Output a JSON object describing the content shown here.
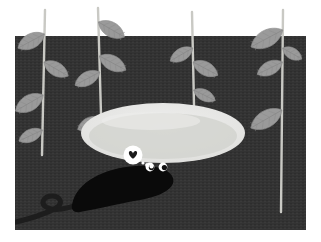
{
  "scene": {
    "title": "Slug dreaming of love beside a puddle",
    "width": 321,
    "height": 242,
    "caption": ""
  },
  "palette": {
    "page_background": "#ffffff",
    "sky_background": "#ffffff",
    "soil_dark": "#333333",
    "soil_texture": "#3b3b3b",
    "soil_shadow": "#262626",
    "puddle_rim": "#e8e8e6",
    "puddle_fill": "#d2d3cf",
    "puddle_highlight": "#ececeb",
    "leaf_fill": "#9a9a9a",
    "leaf_vein": "#8a8a8a",
    "leaf_fill_light": "#a8a8a8",
    "stem_color": "#c9c9c4",
    "slug_body": "#0a0a0a",
    "eye_white": "#ffffff",
    "eye_pupil": "#111111",
    "bubble_white": "#ffffff",
    "heart_color": "#1a1a1a",
    "tail_dark": "#1d1d1d"
  },
  "ground": {
    "label": "dark soil background",
    "x": 15,
    "y": 36,
    "width": 291,
    "height": 194
  },
  "puddle": {
    "label": "puddle",
    "cx": 163,
    "cy": 133,
    "rx": 82,
    "ry": 30,
    "inner_rx": 74,
    "inner_ry": 23
  },
  "plants": [
    {
      "name": "plant-1",
      "stem_x": 45,
      "stem_top": 10,
      "stem_bottom": 155,
      "lean": -3,
      "leaves": [
        {
          "side": "left",
          "y": 34,
          "len": 30,
          "wid": 13,
          "rot": -28
        },
        {
          "side": "left",
          "y": 95,
          "len": 32,
          "wid": 14,
          "rot": -30
        },
        {
          "side": "left",
          "y": 130,
          "len": 26,
          "wid": 11,
          "rot": -25
        },
        {
          "side": "right",
          "y": 62,
          "len": 28,
          "wid": 12,
          "rot": 30
        }
      ]
    },
    {
      "name": "plant-2",
      "stem_x": 98,
      "stem_top": 8,
      "stem_bottom": 150,
      "lean": 4,
      "leaves": [
        {
          "side": "right",
          "y": 22,
          "len": 30,
          "wid": 13,
          "rot": 30
        },
        {
          "side": "right",
          "y": 56,
          "len": 30,
          "wid": 13,
          "rot": 28
        },
        {
          "side": "left",
          "y": 72,
          "len": 28,
          "wid": 12,
          "rot": -28
        },
        {
          "side": "left",
          "y": 118,
          "len": 26,
          "wid": 11,
          "rot": -26
        }
      ]
    },
    {
      "name": "plant-3",
      "stem_x": 192,
      "stem_top": 12,
      "stem_bottom": 105,
      "lean": 2,
      "leaves": [
        {
          "side": "left",
          "y": 48,
          "len": 26,
          "wid": 11,
          "rot": -30
        },
        {
          "side": "right",
          "y": 62,
          "len": 28,
          "wid": 12,
          "rot": 28
        },
        {
          "side": "right",
          "y": 90,
          "len": 24,
          "wid": 10,
          "rot": 26
        }
      ]
    },
    {
      "name": "plant-4",
      "stem_x": 283,
      "stem_top": 10,
      "stem_bottom": 212,
      "lean": -2,
      "leaves": [
        {
          "side": "left",
          "y": 30,
          "len": 36,
          "wid": 15,
          "rot": -28
        },
        {
          "side": "left",
          "y": 62,
          "len": 28,
          "wid": 12,
          "rot": -26
        },
        {
          "side": "left",
          "y": 110,
          "len": 36,
          "wid": 15,
          "rot": -30
        },
        {
          "side": "right",
          "y": 48,
          "len": 22,
          "wid": 10,
          "rot": 30
        }
      ]
    }
  ],
  "slug": {
    "label": "slug",
    "body_path": "M 72 205 C 76 182 104 168 136 166 C 158 165 170 170 173 178 C 176 188 162 196 140 200 C 112 205 92 210 80 212 C 74 213 71 210 72 205 Z",
    "shadow_path": "M 78 200 C 96 186 124 176 150 176 C 160 176 166 178 168 181 C 154 184 120 190 96 198 Z",
    "eyes": [
      {
        "name": "eye-left",
        "cx": 150,
        "cy": 167,
        "r": 4.4,
        "pupil_cx": 151.4,
        "pupil_cy": 167.6,
        "pupil_r": 2.6
      },
      {
        "name": "eye-right",
        "cx": 163,
        "cy": 167,
        "r": 4.4,
        "pupil_cx": 164.4,
        "pupil_cy": 167.6,
        "pupil_r": 2.6
      }
    ]
  },
  "thought_bubble": {
    "label": "thought bubble with heart",
    "main": {
      "cx": 133,
      "cy": 155,
      "r": 9.5
    },
    "heart": {
      "cx": 133,
      "cy": 155,
      "size": 9
    },
    "trail": [
      {
        "cx": 143,
        "cy": 163,
        "r": 1.6
      },
      {
        "cx": 147,
        "cy": 165,
        "r": 1.9
      },
      {
        "cx": 151.5,
        "cy": 166.5,
        "r": 2.1
      }
    ]
  },
  "tail": {
    "label": "curled dark tail",
    "path": "M 16 222 C 32 218 46 214 56 208 C 64 203 60 196 52 196 C 44 196 40 203 46 207 C 54 212 68 209 84 202"
  },
  "annotations": {
    "scene_name": "slug-scene",
    "ground_name": "soil-ground",
    "puddle_name": "puddle",
    "slug_name": "slug-body",
    "bubble_name": "thought-bubble"
  }
}
